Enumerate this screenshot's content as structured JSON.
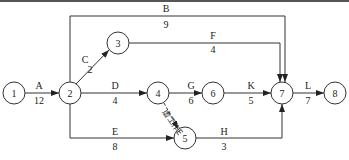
{
  "diagram": {
    "type": "activity-on-arrow network",
    "nodes": [
      {
        "id": "1",
        "label": "1",
        "x": 14,
        "y": 93
      },
      {
        "id": "2",
        "label": "2",
        "x": 70,
        "y": 93
      },
      {
        "id": "3",
        "label": "3",
        "x": 118,
        "y": 43
      },
      {
        "id": "4",
        "label": "4",
        "x": 158,
        "y": 93
      },
      {
        "id": "5",
        "label": "5",
        "x": 185,
        "y": 138
      },
      {
        "id": "6",
        "label": "6",
        "x": 213,
        "y": 93
      },
      {
        "id": "7",
        "label": "7",
        "x": 282,
        "y": 93
      },
      {
        "id": "8",
        "label": "8",
        "x": 335,
        "y": 93
      }
    ],
    "activities": [
      {
        "name": "A",
        "duration": "12",
        "from": "1",
        "to": "2"
      },
      {
        "name": "B",
        "duration": "9",
        "from": "2",
        "to": "7"
      },
      {
        "name": "C",
        "duration": "2",
        "from": "2",
        "to": "3"
      },
      {
        "name": "D",
        "duration": "4",
        "from": "2",
        "to": "4"
      },
      {
        "name": "E",
        "duration": "8",
        "from": "2",
        "to": "5"
      },
      {
        "name": "F",
        "duration": "4",
        "from": "3",
        "to": "7"
      },
      {
        "name": "G",
        "duration": "6",
        "from": "4",
        "to": "6"
      },
      {
        "name": "H",
        "duration": "3",
        "from": "5",
        "to": "7"
      },
      {
        "name": "K",
        "duration": "5",
        "from": "6",
        "to": "7"
      },
      {
        "name": "L",
        "duration": "7",
        "from": "7",
        "to": "8"
      }
    ],
    "dummy": {
      "label": "虚工作E",
      "from": "4",
      "to": "5",
      "style": "dashed"
    }
  }
}
